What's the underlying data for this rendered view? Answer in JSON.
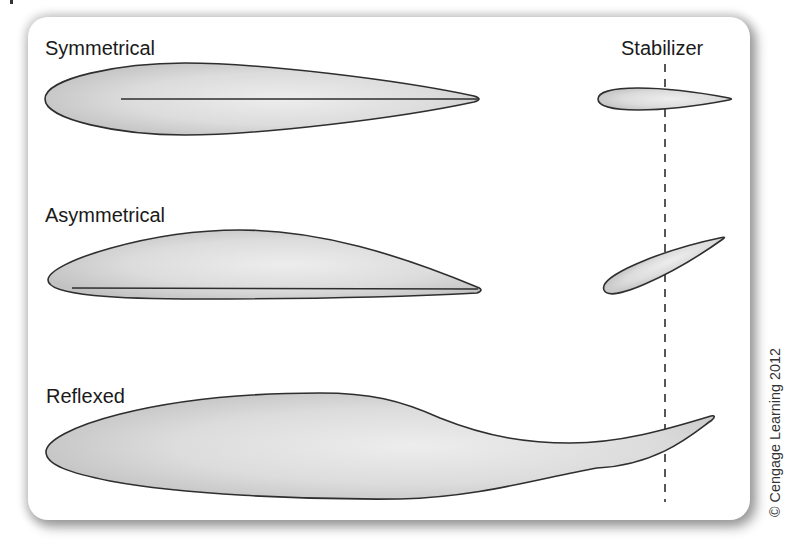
{
  "figure": {
    "labels": {
      "symmetrical": "Symmetrical",
      "asymmetrical": "Asymmetrical",
      "reflexed": "Reflexed",
      "stabilizer": "Stabilizer"
    },
    "credit": "© Cengage Learning 2012",
    "colors": {
      "outline": "#2e2e2e",
      "fill_light": "#ececec",
      "fill_dark": "#c4c4c4",
      "panel": "#ffffff"
    },
    "airfoils": [
      {
        "name": "Symmetrical",
        "has_chord_line": true
      },
      {
        "name": "Asymmetrical",
        "has_chord_line": true
      },
      {
        "name": "Reflexed",
        "has_chord_line": false
      }
    ],
    "stabilizers": [
      {
        "position": "level",
        "angle_deg": 0
      },
      {
        "position": "tilted",
        "angle_deg": -23.6
      }
    ],
    "reference_line": "dashed vertical line through stabilizers"
  }
}
